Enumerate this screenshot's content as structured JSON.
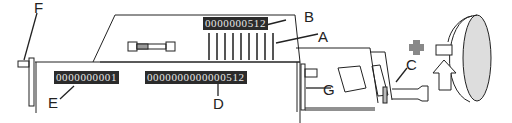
{
  "diagram": {
    "callouts": {
      "A": "A",
      "B": "B",
      "C": "C",
      "D": "D",
      "E": "E",
      "F": "F",
      "G": "G"
    },
    "counters": {
      "B": "0000000512",
      "E": "0000000001",
      "D": "0000000000000512"
    },
    "symbols": {
      "plus": "+",
      "rotation": "clockwise-rotation-arrow"
    },
    "colors": {
      "line": "#222222",
      "counter_bg": "#2b2b2b",
      "counter_text": "#e8e8e8",
      "plus": "#888888",
      "ring_fill": "#cccccc"
    }
  }
}
